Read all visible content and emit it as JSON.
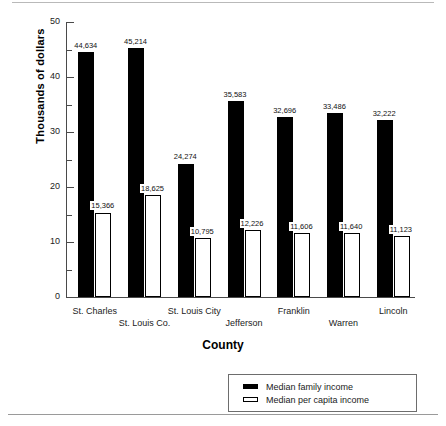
{
  "chart_data": {
    "type": "bar",
    "title": "",
    "xlabel": "County",
    "ylabel": "Thousands of dollars",
    "ylim": [
      0,
      50
    ],
    "ytick_labels": [
      "0",
      "10",
      "20",
      "30",
      "40",
      "50"
    ],
    "ytick_values": [
      0,
      10,
      20,
      30,
      40,
      50
    ],
    "minor_tick_values": [
      5,
      15,
      25,
      35,
      45
    ],
    "grid": false,
    "legend_position": "bottom-right",
    "categories": [
      "St. Charles",
      "St. Louis Co.",
      "St. Louis City",
      "Jefferson",
      "Franklin",
      "Warren",
      "Lincoln"
    ],
    "series": [
      {
        "name": "Median family income",
        "color": "#000000",
        "values": [
          44634,
          45214,
          24274,
          35583,
          32696,
          33486,
          32222
        ],
        "labels": [
          "44,634",
          "45,214",
          "24,274",
          "35,583",
          "32,696",
          "33,486",
          "32,222"
        ]
      },
      {
        "name": "Median per capita income",
        "color": "#ffffff",
        "values": [
          15366,
          18625,
          10795,
          12226,
          11606,
          11640,
          11123
        ],
        "labels": [
          "15,366",
          "18,625",
          "10,795",
          "12,226",
          "11,606",
          "11,640",
          "11,123"
        ]
      }
    ]
  },
  "axis": {
    "y_title": "Thousands of dollars",
    "x_title": "County"
  },
  "legend": {
    "items": [
      {
        "label": "Median family income",
        "swatch": "filled-black"
      },
      {
        "label": "Median per capita income",
        "swatch": "outlined-white"
      }
    ]
  }
}
